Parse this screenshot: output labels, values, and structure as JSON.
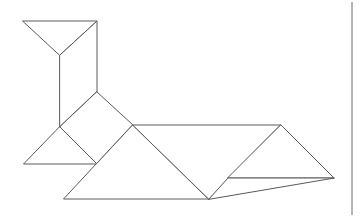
{
  "canvas": {
    "width": 363,
    "height": 217,
    "background_color": "#ffffff"
  },
  "figure": {
    "line_color": "#5a5a5a",
    "fill_color": "#ffffff",
    "stroke_width": 1
  },
  "page_rule": {
    "name": "right-margin-rule",
    "color": "#6b6b6b",
    "x": 352,
    "y1": 2,
    "y2": 215
  },
  "chart_data": {
    "type": "diagram",
    "xlabel": "",
    "ylabel": "",
    "xlim": [
      0,
      363
    ],
    "ylim": [
      0,
      217
    ],
    "grid": false,
    "legend": "none",
    "pieces": [
      {
        "name": "head-triangle",
        "shape": "triangle",
        "points": [
          [
            23,
            21
          ],
          [
            97,
            21
          ],
          [
            60,
            55
          ]
        ]
      },
      {
        "name": "neck-parallelogram",
        "shape": "quadrilateral",
        "points": [
          [
            60,
            55
          ],
          [
            97,
            21
          ],
          [
            97,
            92
          ],
          [
            60,
            127
          ]
        ]
      },
      {
        "name": "body-square",
        "shape": "quadrilateral",
        "points": [
          [
            97,
            92
          ],
          [
            133,
            125
          ],
          [
            97,
            164
          ],
          [
            60,
            127
          ]
        ]
      },
      {
        "name": "front-leg-triangle",
        "shape": "triangle",
        "points": [
          [
            24,
            164
          ],
          [
            97,
            164
          ],
          [
            60,
            127
          ]
        ]
      },
      {
        "name": "lower-body-triangle",
        "shape": "triangle",
        "points": [
          [
            64,
            199
          ],
          [
            209,
            199
          ],
          [
            133,
            125
          ]
        ]
      },
      {
        "name": "back-triangle",
        "shape": "triangle",
        "points": [
          [
            133,
            125
          ],
          [
            281,
            125
          ],
          [
            209,
            199
          ]
        ]
      },
      {
        "name": "tail-upper-triangle",
        "shape": "triangle",
        "points": [
          [
            281,
            125
          ],
          [
            334,
            178
          ],
          [
            228,
            178
          ]
        ]
      },
      {
        "name": "tail-lower-triangle",
        "shape": "triangle",
        "points": [
          [
            209,
            199
          ],
          [
            228,
            178
          ],
          [
            334,
            178
          ]
        ]
      }
    ],
    "vertices": [
      [
        23,
        21
      ],
      [
        97,
        21
      ],
      [
        60,
        55
      ],
      [
        97,
        92
      ],
      [
        60,
        127
      ],
      [
        133,
        125
      ],
      [
        97,
        164
      ],
      [
        24,
        164
      ],
      [
        64,
        199
      ],
      [
        209,
        199
      ],
      [
        281,
        125
      ],
      [
        334,
        178
      ],
      [
        228,
        178
      ]
    ]
  }
}
